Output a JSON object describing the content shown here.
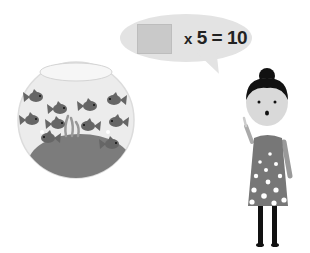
{
  "scene": {
    "description": "Math word problem illustration: fishbowl with fish and a girl asking an equation",
    "speech_bubble": {
      "blank_box": "",
      "operator": "x",
      "multiplier": "5",
      "equals": "=",
      "result": "10",
      "equation_text": "x 5 = 10"
    },
    "fishbowl": {
      "fish_count": 10,
      "has_seaweed": true,
      "has_gravel": true
    },
    "character": {
      "role": "girl",
      "dress_pattern": "polka-dot",
      "gesture": "raised-finger"
    },
    "colors": {
      "bubble": "#e3e3e3",
      "blank_box": "#c9c9c9",
      "fish": "#6a6a6a",
      "gravel": "#7c7c7c",
      "bowl": "#ececec",
      "hair": "#111111",
      "dress": "#777777",
      "legs": "#111111"
    }
  }
}
